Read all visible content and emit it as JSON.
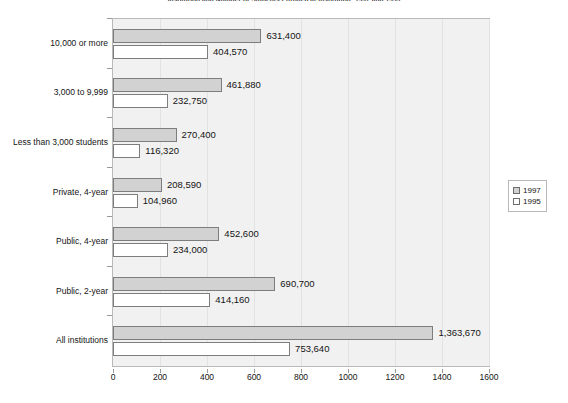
{
  "chart_data": {
    "type": "bar",
    "orientation": "horizontal",
    "title": "Institution and Number of Students Enrolled at Institution: 1997 and 1995",
    "xlabel": "",
    "ylabel": "",
    "xlim": [
      0,
      1600
    ],
    "x_ticks": [
      0,
      200,
      400,
      600,
      800,
      1000,
      1200,
      1400,
      1600
    ],
    "x_tick_labels": [
      "0",
      "200",
      "400",
      "600",
      "800",
      "1000",
      "1200",
      "1400",
      "1600"
    ],
    "x_unit_note": "values plotted in thousands",
    "grid": "vertical",
    "legend_position": "right",
    "categories": [
      "All institutions",
      "Public, 2-year",
      "Public, 4-year",
      "Private, 4-year",
      "Less than 3,000 students",
      "3,000 to 9,999",
      "10,000 or more"
    ],
    "series": [
      {
        "name": "1997",
        "color": "#d2d2d2",
        "values": [
          1363670,
          690700,
          452600,
          208590,
          270400,
          461880,
          631400
        ],
        "labels": [
          "1,363,670",
          "690,700",
          "452,600",
          "208,590",
          "270,400",
          "461,880",
          "631,400"
        ]
      },
      {
        "name": "1995",
        "color": "#ffffff",
        "values": [
          753640,
          414160,
          234000,
          104960,
          116320,
          232750,
          404570
        ],
        "labels": [
          "753,640",
          "414,160",
          "234,000",
          "104,960",
          "116,320",
          "232,750",
          "404,570"
        ]
      }
    ]
  },
  "legend": {
    "entries": [
      {
        "label": "1997",
        "color": "#d2d2d2"
      },
      {
        "label": "1995",
        "color": "#ffffff"
      }
    ]
  },
  "colors": {
    "plot_background": "#f1f1f1",
    "plot_border": "#b9b9b9",
    "gridline": "#e2e2e2",
    "bar_outline": "#7d7d7d",
    "series_1997": "#d2d2d2",
    "series_1995": "#ffffff",
    "text": "#141414"
  }
}
